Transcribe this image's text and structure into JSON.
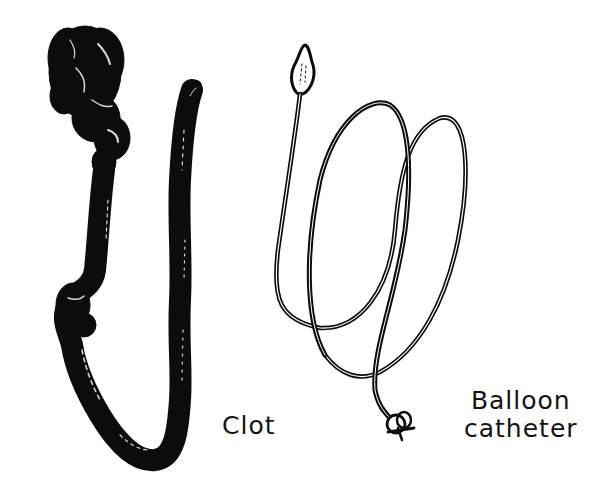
{
  "figure": {
    "labels": {
      "clot": "Clot",
      "balloon_catheter_line1": "Balloon",
      "balloon_catheter_line2": "catheter"
    },
    "items": [
      {
        "name": "clot",
        "description": "Long dark elongated thrombus with a bulbous head"
      },
      {
        "name": "balloon-catheter",
        "description": "Looped catheter with balloon tip and connector hub"
      }
    ],
    "colors": {
      "ink": "#0c0c0c",
      "background": "#ffffff"
    }
  }
}
